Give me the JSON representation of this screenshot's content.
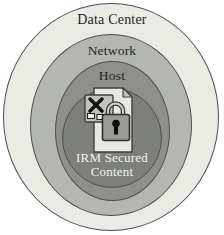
{
  "diagram": {
    "background_color": "#ffffff",
    "outline_color": "#4f4f4f",
    "rings": [
      {
        "label": "Data Center",
        "fill": "#e9ebe4",
        "text_color": "#1f1f1f"
      },
      {
        "label": "Network",
        "fill": "#b4b6b1",
        "text_color": "#1f1f1f"
      },
      {
        "label": "Host",
        "fill": "#8e908b",
        "text_color": "#1f1f1f"
      },
      {
        "label": "IRM Secured Content",
        "fill": "#7d7f7a",
        "text_color": "#f3f3ef"
      }
    ],
    "icon": {
      "name": "secured-document-icon",
      "page_fill": "#e8e8e3",
      "fold_fill": "#c6c6c1",
      "card_fill": "#c3c3be",
      "x_color": "#101010",
      "lock_body_fill": "#9a9b96",
      "shackle_color": "#3c3c3a",
      "keyhole_color": "#0d0d0d",
      "outline": "#3f3f3d"
    }
  }
}
